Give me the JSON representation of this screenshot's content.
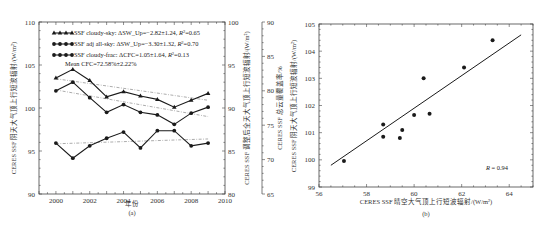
{
  "chart_data": [
    {
      "panel": "(a)",
      "type": "line",
      "caption": "(a)",
      "xlabel": "年份",
      "ylabel_left": "CERES SSF 阴天大气顶上行短波辐射/(W/m²)",
      "ylabel_right1": "CERES SSF 调整后全天大气顶上行短波辐射/(W/m²)",
      "ylabel_right2": "CERES SSF 总云量覆盖率/%",
      "xlim": [
        1999,
        2010
      ],
      "x_ticks": [
        "2000",
        "2002",
        "2004",
        "2006",
        "2008",
        "2010"
      ],
      "ylim_left": [
        90,
        110
      ],
      "y_ticks_left": [
        "90",
        "95",
        "100",
        "105",
        "110"
      ],
      "ylim_right1": [
        80,
        100
      ],
      "y_ticks_right1": [
        "80",
        "85",
        "90",
        "95",
        "100"
      ],
      "ylim_right2": [
        65,
        90
      ],
      "y_ticks_right2": [
        "65",
        "70",
        "75",
        "80",
        "85",
        "90"
      ],
      "x": [
        2000,
        2001,
        2002,
        2003,
        2004,
        2005,
        2006,
        2007,
        2008,
        2009
      ],
      "series": [
        {
          "name": "SSF cloudy-sky: ΔSW_Up=−2.82±1.24, R²=0.65",
          "marker": "triangle",
          "axis": "left",
          "values": [
            103.5,
            104.5,
            103.2,
            101.3,
            101.9,
            101.4,
            101.0,
            100.1,
            100.9,
            101.7
          ],
          "trend": [
            103.4,
            100.9
          ]
        },
        {
          "name": "SSF adj all-sky: ΔSW_Up=−3.30±1.32, R²=0.70",
          "marker": "circle",
          "axis": "left",
          "values": [
            102.0,
            103.0,
            101.2,
            99.5,
            100.4,
            99.5,
            99.2,
            98.1,
            99.4,
            100.1
          ],
          "trend": [
            102.1,
            99.0
          ]
        },
        {
          "name": "SSF cloudy-frac: ΔCFC=1.05±1.64, R²=0.13",
          "marker": "circle",
          "axis": "right2",
          "values": [
            72.4,
            70.2,
            72.0,
            73.1,
            74.0,
            71.7,
            74.2,
            74.2,
            72.0,
            72.4
          ],
          "trend": [
            72.3,
            73.0
          ]
        }
      ],
      "annotation": "Mean CFC=72.58%±2.22%",
      "legend_position": "top-left",
      "grid": false
    },
    {
      "panel": "(b)",
      "type": "scatter",
      "caption": "(b)",
      "xlabel": "CERES SSF 晴空大气顶上行短波辐射/(W/m²)",
      "ylabel": "CERES SSF 阴天大气顶上行短波辐射/(W/m²)",
      "xlim": [
        56,
        65
      ],
      "x_ticks": [
        "56",
        "58",
        "60",
        "62",
        "64"
      ],
      "ylim": [
        99,
        105
      ],
      "y_ticks": [
        "99",
        "100",
        "101",
        "102",
        "103",
        "104",
        "105"
      ],
      "points": [
        [
          57.05,
          99.96
        ],
        [
          58.7,
          101.3
        ],
        [
          58.7,
          100.85
        ],
        [
          59.4,
          100.8
        ],
        [
          59.5,
          101.1
        ],
        [
          60.0,
          101.65
        ],
        [
          60.4,
          103.0
        ],
        [
          60.65,
          101.7
        ],
        [
          62.1,
          103.4
        ],
        [
          63.3,
          104.4
        ]
      ],
      "fit_line": [
        [
          56.5,
          99.8
        ],
        [
          64.5,
          104.6
        ]
      ],
      "annotation": "R = 0.94",
      "grid": false
    }
  ],
  "panel_a": {
    "legend": [
      "SSF cloudy-sky: ΔSW_Up=−2.82±1.24, ",
      "SSF adj all-sky: ΔSW_Up=−3.30±1.32, ",
      "SSF cloudy-frac: ΔCFC=1.05±1.64, "
    ],
    "legend_r2": [
      "=0.65",
      "=0.70",
      "=0.13"
    ],
    "mean_cfc": "Mean CFC=72.58%±2.22%",
    "xlabel": "年份",
    "caption": "(a)",
    "ylabel_left": "CERES SSF 阴天大气顶上行短波辐射/(W/m²)",
    "ylabel_right1": "CERES SSF 调整后全天大气顶上行短波辐射/(W/m²)",
    "ylabel_right2": "CERES SSF 总云量覆盖率/%"
  },
  "panel_b": {
    "r_label": "R",
    "r_value": " = 0.94",
    "xlabel": "CERES SSF 晴空大气顶上行短波辐射/(W/m²)",
    "ylabel": "CERES SSF 阴天大气顶上行短波辐射/(W/m²)",
    "caption": "(b)"
  },
  "colors": {
    "line": "#1a1a1a",
    "trend": "#888888",
    "frame": "#444444"
  }
}
